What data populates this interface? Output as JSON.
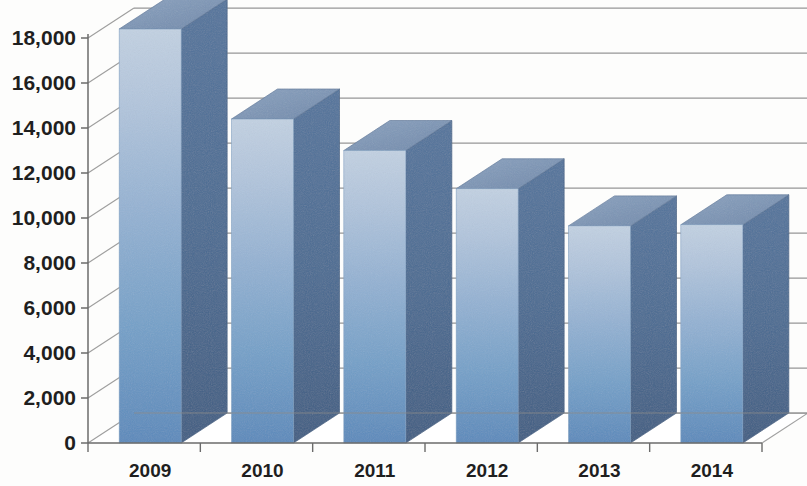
{
  "chart_data": {
    "type": "bar",
    "title": "",
    "subtitle": "",
    "xlabel": "",
    "ylabel": "",
    "categories": [
      "2009",
      "2010",
      "2011",
      "2012",
      "2013",
      "2014"
    ],
    "values": [
      18400,
      14400,
      13000,
      11300,
      9650,
      9700
    ],
    "ylim": [
      0,
      18000
    ],
    "y_ticks": [
      0,
      2000,
      4000,
      6000,
      8000,
      10000,
      12000,
      14000,
      16000,
      18000
    ],
    "y_tick_labels": [
      "0",
      "2,000",
      "4,000",
      "6,000",
      "8,000",
      "10,000",
      "12,000",
      "14,000",
      "16,000",
      "18,000"
    ],
    "grid": true,
    "grid_axis": "y",
    "legend": false,
    "legend_position": "none",
    "style": "3d-column",
    "series": [
      {
        "name": "Series 1",
        "values": [
          18400,
          14400,
          13000,
          11300,
          9650,
          9700
        ]
      }
    ],
    "annotations": []
  },
  "colors": {
    "bar_front_top": "#b9cade",
    "bar_front_bottom": "#5d8cbd",
    "bar_top_face": "#7b93b3",
    "bar_side_face": "#4c6f97",
    "bar_side_face_dark": "#3f5f85",
    "gridline": "#7a7a7a",
    "axis_line": "#6b6b6b",
    "floor_line": "#8a8a8a",
    "tick_label": "#1f1f1f",
    "background": "#fdfdfc"
  },
  "axes": {
    "y_axis_label_suffix": "",
    "x_axis_name": "Year",
    "y_axis_name": "Value"
  }
}
